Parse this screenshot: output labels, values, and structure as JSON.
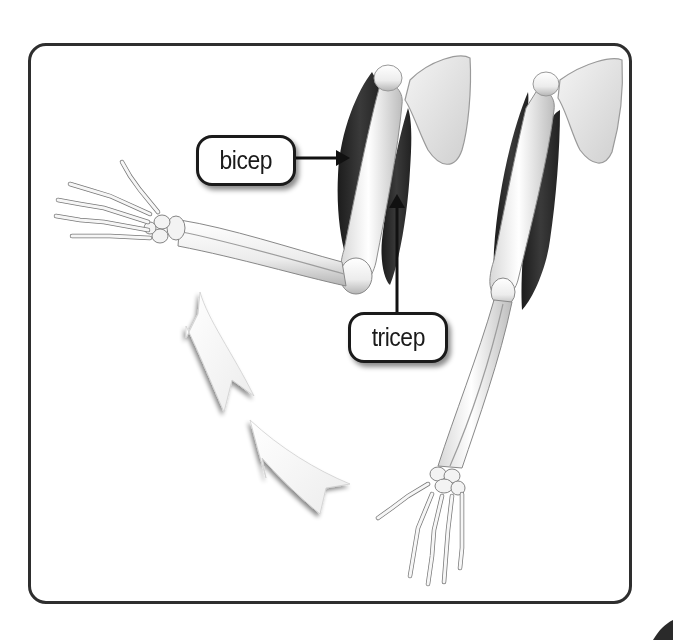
{
  "diagram": {
    "labels": {
      "bicep": "bicep",
      "tricep": "tricep"
    },
    "figures": [
      {
        "name": "flexed-arm",
        "description": "Arm bent at elbow, forearm horizontal pointing left, bicep contracted"
      },
      {
        "name": "extended-arm",
        "description": "Arm straight, forearm pointing down, tricep contracted"
      }
    ],
    "motion_arrows": {
      "count": 2,
      "direction": "curving upward from lower-right toward upper-left",
      "meaning": "forearm flexing upward"
    },
    "colors": {
      "frame_border": "#2e2e2e",
      "muscle": "#2b2b2b",
      "bone": "#f2f2f2",
      "bone_outline": "#8a8a8a",
      "label_border": "#1a1a1a",
      "arrow_fill": "#f6f6f6"
    }
  }
}
